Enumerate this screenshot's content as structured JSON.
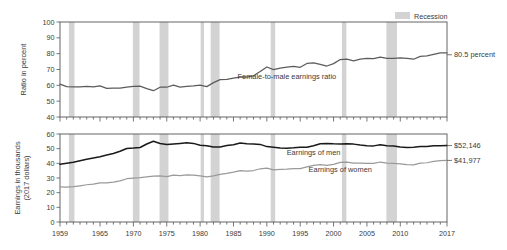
{
  "figure": {
    "legend": {
      "label": "Recession",
      "swatch_color": "#d3d3d3"
    }
  },
  "chart_data": [
    {
      "id": "ratio_panel",
      "type": "line",
      "title": "",
      "xlabel": "",
      "ylabel": "Ratio in percent",
      "xlim": [
        1959,
        2017
      ],
      "ylim": [
        40,
        100
      ],
      "yticks": [
        40,
        50,
        60,
        70,
        80,
        90,
        100
      ],
      "xticks": [
        1959,
        1965,
        1970,
        1975,
        1980,
        1985,
        1990,
        1995,
        2000,
        2005,
        2010,
        2017
      ],
      "grid": false,
      "legend_position": "none",
      "annotations": [
        {
          "name": "series-inline-label",
          "text": "Female-to-male earnings ratio",
          "x": 1993,
          "y": 66
        },
        {
          "name": "end-value-label",
          "text": "80.5 percent",
          "x": 2017,
          "y": 79.3
        }
      ],
      "series": [
        {
          "name": "Female-to-male earnings ratio",
          "color": "#5c5c5c",
          "x": [
            1959,
            1960,
            1961,
            1962,
            1963,
            1964,
            1965,
            1966,
            1967,
            1968,
            1969,
            1970,
            1971,
            1972,
            1973,
            1974,
            1975,
            1976,
            1977,
            1978,
            1979,
            1980,
            1981,
            1982,
            1983,
            1984,
            1985,
            1986,
            1987,
            1988,
            1989,
            1990,
            1991,
            1992,
            1993,
            1994,
            1995,
            1996,
            1997,
            1998,
            1999,
            2000,
            2001,
            2002,
            2003,
            2004,
            2005,
            2006,
            2007,
            2008,
            2009,
            2010,
            2011,
            2012,
            2013,
            2014,
            2015,
            2016,
            2017
          ],
          "values": [
            60.8,
            59.2,
            59.1,
            59.1,
            59.4,
            59.1,
            59.7,
            58.1,
            58.2,
            58.2,
            58.9,
            59.4,
            59.5,
            57.9,
            56.6,
            58.8,
            58.8,
            60.1,
            58.9,
            59.4,
            59.7,
            60.2,
            59.2,
            61.7,
            63.6,
            63.7,
            64.5,
            65.2,
            65.2,
            66.0,
            68.7,
            71.6,
            69.9,
            70.8,
            71.5,
            72.0,
            71.4,
            73.8,
            74.2,
            73.2,
            72.2,
            73.7,
            76.3,
            76.6,
            75.5,
            76.6,
            77.0,
            76.9,
            77.8,
            77.1,
            77.0,
            77.4,
            77.0,
            76.5,
            78.3,
            78.6,
            79.6,
            80.5,
            80.5
          ]
        }
      ],
      "recessions": [
        {
          "start": 1960.33,
          "end": 1961.17
        },
        {
          "start": 1969.92,
          "end": 1970.92
        },
        {
          "start": 1973.92,
          "end": 1975.25
        },
        {
          "start": 1980.08,
          "end": 1980.58
        },
        {
          "start": 1981.58,
          "end": 1982.92
        },
        {
          "start": 1990.58,
          "end": 1991.25
        },
        {
          "start": 2001.25,
          "end": 2001.92
        },
        {
          "start": 2007.92,
          "end": 2009.5
        }
      ]
    },
    {
      "id": "earnings_panel",
      "type": "line",
      "title": "",
      "xlabel": "",
      "ylabel": "Earnings in thousands (2017 dollars)",
      "xlim": [
        1959,
        2017
      ],
      "ylim": [
        0,
        60
      ],
      "yticks": [
        0,
        10,
        20,
        30,
        40,
        50,
        60
      ],
      "xticks": [
        1959,
        1965,
        1970,
        1975,
        1980,
        1985,
        1990,
        1995,
        2000,
        2005,
        2010,
        2017
      ],
      "xticklabels": [
        "1959",
        "1965",
        "1970",
        "1975",
        "1980",
        "1985",
        "1990",
        "1995",
        "2000",
        "2005",
        "2010",
        "2017"
      ],
      "grid": false,
      "legend_position": "none",
      "annotations": [
        {
          "name": "series-inline-label-men",
          "text": "Earnings of men",
          "x": 1997,
          "y": 47.5
        },
        {
          "name": "series-inline-label-women",
          "text": "Earnings of women",
          "x": 2001,
          "y": 36.0
        },
        {
          "name": "end-value-label-men",
          "text": "$52,146",
          "x": 2017,
          "y": 52.1
        },
        {
          "name": "end-value-label-women",
          "text": "$41,977",
          "x": 2017,
          "y": 42.0
        }
      ],
      "series": [
        {
          "name": "Earnings of men",
          "color": "#1a1a1a",
          "x": [
            1959,
            1960,
            1961,
            1962,
            1963,
            1964,
            1965,
            1966,
            1967,
            1968,
            1969,
            1970,
            1971,
            1972,
            1973,
            1974,
            1975,
            1976,
            1977,
            1978,
            1979,
            1980,
            1981,
            1982,
            1983,
            1984,
            1985,
            1986,
            1987,
            1988,
            1989,
            1990,
            1991,
            1992,
            1993,
            1994,
            1995,
            1996,
            1997,
            1998,
            1999,
            2000,
            2001,
            2002,
            2003,
            2004,
            2005,
            2006,
            2007,
            2008,
            2009,
            2010,
            2011,
            2012,
            2013,
            2014,
            2015,
            2016,
            2017
          ],
          "values": [
            39.3,
            40.1,
            40.8,
            41.8,
            42.8,
            43.6,
            44.5,
            45.7,
            46.7,
            48.2,
            50.1,
            50.4,
            50.8,
            53.2,
            55.1,
            53.5,
            52.8,
            53.2,
            53.6,
            54.0,
            53.6,
            52.3,
            52.0,
            51.1,
            51.1,
            52.1,
            52.7,
            53.8,
            53.3,
            53.2,
            52.9,
            51.4,
            51.0,
            50.5,
            50.3,
            50.6,
            51.0,
            50.9,
            52.0,
            53.4,
            53.5,
            53.3,
            53.2,
            53.3,
            53.1,
            52.5,
            52.0,
            51.9,
            52.6,
            52.0,
            51.8,
            51.2,
            50.8,
            51.0,
            51.4,
            51.4,
            52.0,
            52.0,
            52.1
          ]
        },
        {
          "name": "Earnings of women",
          "color": "#9a9a9a",
          "x": [
            1959,
            1960,
            1961,
            1962,
            1963,
            1964,
            1965,
            1966,
            1967,
            1968,
            1969,
            1970,
            1971,
            1972,
            1973,
            1974,
            1975,
            1976,
            1977,
            1978,
            1979,
            1980,
            1981,
            1982,
            1983,
            1984,
            1985,
            1986,
            1987,
            1988,
            1989,
            1990,
            1991,
            1992,
            1993,
            1994,
            1995,
            1996,
            1997,
            1998,
            1999,
            2000,
            2001,
            2002,
            2003,
            2004,
            2005,
            2006,
            2007,
            2008,
            2009,
            2010,
            2011,
            2012,
            2013,
            2014,
            2015,
            2016,
            2017
          ],
          "values": [
            23.9,
            23.7,
            24.1,
            24.7,
            25.4,
            25.8,
            26.6,
            26.6,
            27.2,
            28.0,
            29.5,
            29.9,
            30.2,
            30.8,
            31.2,
            31.5,
            31.0,
            32.0,
            31.6,
            32.1,
            32.0,
            31.5,
            30.8,
            31.5,
            32.5,
            33.2,
            34.0,
            35.1,
            34.7,
            35.1,
            36.3,
            36.8,
            35.6,
            35.8,
            36.0,
            36.4,
            36.4,
            37.6,
            38.6,
            39.1,
            38.6,
            39.3,
            40.6,
            40.8,
            40.1,
            40.2,
            40.0,
            39.9,
            40.9,
            40.1,
            39.9,
            39.6,
            39.1,
            39.0,
            40.2,
            40.4,
            41.4,
            41.8,
            42.0
          ]
        }
      ],
      "recessions": [
        {
          "start": 1960.33,
          "end": 1961.17
        },
        {
          "start": 1969.92,
          "end": 1970.92
        },
        {
          "start": 1973.92,
          "end": 1975.25
        },
        {
          "start": 1980.08,
          "end": 1980.58
        },
        {
          "start": 1981.58,
          "end": 1982.92
        },
        {
          "start": 1990.58,
          "end": 1991.25
        },
        {
          "start": 2001.25,
          "end": 2001.92
        },
        {
          "start": 2007.92,
          "end": 2009.5
        }
      ]
    }
  ]
}
